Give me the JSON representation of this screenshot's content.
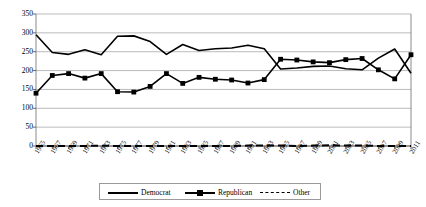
{
  "chart_data": {
    "type": "line",
    "title": "",
    "subtitle": "",
    "xlabel": "",
    "ylabel": "",
    "ylim": [
      0,
      350
    ],
    "xlim": [
      "1965",
      "2011"
    ],
    "grid": true,
    "grid_axis": "y",
    "legend_position": "bottom",
    "yticks": [
      0,
      50,
      100,
      150,
      200,
      250,
      300,
      350
    ],
    "ytick_labels": [
      "0",
      "50",
      "100",
      "150",
      "200",
      "250",
      "300",
      "350"
    ],
    "categories": [
      "1965",
      "1967",
      "1969",
      "1971",
      "1973",
      "1975",
      "1977",
      "1979",
      "1981",
      "1983",
      "1985",
      "1987",
      "1989",
      "1991",
      "1993",
      "1995",
      "1997",
      "1999",
      "2001",
      "2003",
      "2005",
      "2007",
      "2009",
      "2011"
    ],
    "series": [
      {
        "name": "Democrat",
        "marker": "none",
        "linestyle": "solid",
        "color": "#000000",
        "values": [
          295,
          248,
          243,
          255,
          242,
          291,
          292,
          277,
          243,
          269,
          253,
          258,
          260,
          267,
          258,
          204,
          207,
          211,
          212,
          205,
          202,
          233,
          257,
          193
        ]
      },
      {
        "name": "Republican",
        "marker": "square",
        "linestyle": "solid",
        "color": "#000000",
        "values": [
          140,
          187,
          192,
          180,
          192,
          144,
          143,
          158,
          192,
          166,
          182,
          177,
          175,
          167,
          176,
          230,
          228,
          223,
          221,
          229,
          232,
          202,
          178,
          242
        ]
      },
      {
        "name": "Other",
        "marker": "none",
        "linestyle": "dashed",
        "color": "#000000",
        "values": [
          0,
          0,
          0,
          0,
          1,
          0,
          0,
          0,
          0,
          0,
          0,
          0,
          0,
          1,
          1,
          1,
          0,
          1,
          2,
          1,
          1,
          0,
          0,
          0
        ]
      }
    ]
  },
  "legend": {
    "entries": [
      {
        "label": "Democrat",
        "marker": "line-solid"
      },
      {
        "label": "Republican",
        "marker": "line-square-marker"
      },
      {
        "label": "Other",
        "marker": "line-dashed"
      }
    ]
  }
}
